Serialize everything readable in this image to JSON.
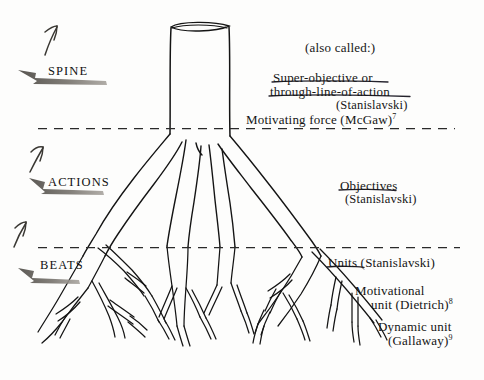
{
  "figure": {
    "kind": "hand-drawn tree-root diagram",
    "background_color": "#fdfdfc",
    "ink_color": "#151515",
    "arrow_color": "#5d5a55"
  },
  "bands": [
    {
      "name": "spine",
      "label": "SPINE",
      "divider_below_y": 128
    },
    {
      "name": "actions",
      "label": "ACTIONS",
      "divider_below_y": 247
    },
    {
      "name": "beats",
      "label": "BEATS",
      "divider_below_y": null
    }
  ],
  "annotations": {
    "also_called": "(also called:)",
    "spine_terms": {
      "line1": "Super-objective or",
      "line2": "through-line-of-action",
      "attribution": "(Stanislavski)",
      "alt_term": "Motivating force   (McGaw)",
      "alt_term_note": "7"
    },
    "actions_terms": {
      "line1": "Objectives",
      "attribution": "(Stanislavski)"
    },
    "beats_terms": {
      "line1": "Units (Stanislavski)",
      "line2": "Motivational",
      "line3": "unit (Dietrich)",
      "line3_note": "8",
      "line4": "Dynamic unit",
      "line5": "(Gallaway)",
      "line5_note": "9"
    }
  }
}
